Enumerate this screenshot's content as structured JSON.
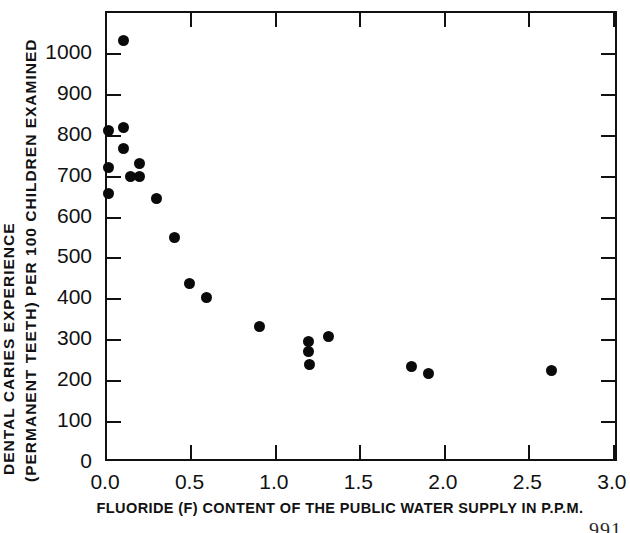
{
  "chart_data": {
    "type": "scatter",
    "title": "",
    "xlabel": "FLUORIDE (F) CONTENT OF THE PUBLIC WATER SUPPLY  IN P.P.M.",
    "ylabel_line1": "DENTAL CARIES EXPERIENCE",
    "ylabel_line2": "(PERMANENT TEETH) PER 100 CHILDREN EXAMINED",
    "xlim": [
      0.0,
      3.03
    ],
    "ylim": [
      0,
      1100
    ],
    "xticks": [
      0.0,
      0.5,
      1.0,
      1.5,
      2.0,
      2.5,
      3.0
    ],
    "xtick_labels": [
      "0.0",
      "0.5",
      "1.0",
      "1.5",
      "2.0",
      "2.5",
      "3.0"
    ],
    "yticks": [
      0,
      100,
      200,
      300,
      400,
      500,
      600,
      700,
      800,
      900,
      1000
    ],
    "ytick_labels": [
      "0",
      "100",
      "200",
      "300",
      "400",
      "500",
      "600",
      "700",
      "800",
      "900",
      "1000"
    ],
    "grid": false,
    "legend": "none",
    "marker": "filled-circle",
    "marker_color": "#0a0a0a",
    "points": [
      {
        "x": 0.01,
        "y": 812
      },
      {
        "x": 0.01,
        "y": 722
      },
      {
        "x": 0.01,
        "y": 660
      },
      {
        "x": 0.1,
        "y": 1034
      },
      {
        "x": 0.1,
        "y": 820
      },
      {
        "x": 0.1,
        "y": 768
      },
      {
        "x": 0.19,
        "y": 731
      },
      {
        "x": 0.14,
        "y": 700
      },
      {
        "x": 0.19,
        "y": 700
      },
      {
        "x": 0.29,
        "y": 646
      },
      {
        "x": 0.4,
        "y": 552
      },
      {
        "x": 0.49,
        "y": 440
      },
      {
        "x": 0.59,
        "y": 404
      },
      {
        "x": 0.9,
        "y": 333
      },
      {
        "x": 1.19,
        "y": 297
      },
      {
        "x": 1.19,
        "y": 273
      },
      {
        "x": 1.2,
        "y": 241
      },
      {
        "x": 1.31,
        "y": 309
      },
      {
        "x": 1.8,
        "y": 236
      },
      {
        "x": 1.9,
        "y": 219
      },
      {
        "x": 2.63,
        "y": 225
      }
    ]
  },
  "figure": {
    "page_number": "991"
  }
}
